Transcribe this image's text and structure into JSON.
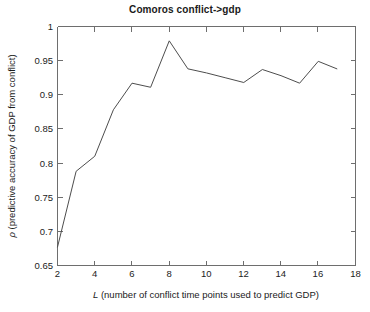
{
  "chart_data": {
    "type": "line",
    "title": "Comoros conflict->gdp",
    "xlabel": "L (number of conflict time points used to predict GDP)",
    "xlabel_italic_prefix": "L",
    "xlabel_rest": " (number of conflict time points used to predict GDP)",
    "ylabel": "ρ (predictive accuracy of GDP from conflict)",
    "ylabel_symbol": "ρ",
    "ylabel_rest": " (predictive accuracy of GDP from conflict)",
    "xlim": [
      2,
      18
    ],
    "ylim": [
      0.65,
      1
    ],
    "xticks": [
      2,
      4,
      6,
      8,
      10,
      12,
      14,
      16,
      18
    ],
    "xtick_labels": [
      "2",
      "4",
      "6",
      "8",
      "10",
      "12",
      "14",
      "16",
      "18"
    ],
    "yticks": [
      0.65,
      0.7,
      0.75,
      0.8,
      0.85,
      0.9,
      0.95,
      1
    ],
    "ytick_labels": [
      "0.65",
      "0.7",
      "0.75",
      "0.8",
      "0.85",
      "0.9",
      "0.95",
      "1"
    ],
    "grid": false,
    "legend": null,
    "series": [
      {
        "name": "predictive accuracy",
        "color": "#4d4d4d",
        "x": [
          2,
          3,
          4,
          5,
          6,
          7,
          8,
          9,
          10,
          11,
          12,
          13,
          14,
          15,
          16,
          17
        ],
        "values": [
          0.677,
          0.788,
          0.81,
          0.878,
          0.917,
          0.911,
          0.979,
          0.938,
          0.932,
          0.925,
          0.918,
          0.937,
          0.928,
          0.917,
          0.949,
          0.938
        ]
      }
    ]
  },
  "figure": {
    "background_color": "#ffffff",
    "axis_color": "#6e6e6e",
    "text_color": "#1a1a1a"
  }
}
